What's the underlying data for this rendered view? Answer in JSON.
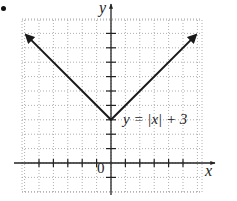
{
  "bullet": "•",
  "chart_data": {
    "type": "line",
    "title": "",
    "equation": "y = |x| + 3",
    "xlabel": "x",
    "ylabel": "y",
    "origin_label": "0",
    "xlim": [
      -6,
      6
    ],
    "ylim": [
      -2,
      9
    ],
    "grid": true,
    "grid_style": "dotted",
    "x_ticks": [
      -5,
      -4,
      -3,
      -2,
      -1,
      1,
      2,
      3,
      4,
      5
    ],
    "y_ticks": [
      -1,
      1,
      2,
      3,
      4,
      5,
      6,
      7,
      8,
      9
    ],
    "series": [
      {
        "name": "y = |x| + 3",
        "x": [
          -5.9,
          0,
          5.9
        ],
        "y": [
          8.9,
          3,
          8.9
        ],
        "arrows": "both-ends",
        "vertex": [
          0,
          3
        ]
      }
    ]
  },
  "layout": {
    "origin_px": [
      111,
      163
    ],
    "unit_px": 14.4,
    "grid_px": {
      "left": 22,
      "right": 202,
      "top": 20,
      "bottom": 192
    }
  },
  "colors": {
    "line": "#1a1a1a",
    "grid": "#9a9a9a",
    "axis": "#222222"
  }
}
